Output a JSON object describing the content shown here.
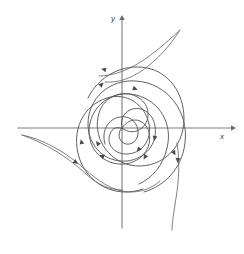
{
  "figure": {
    "name": "phase-portrait-spiral",
    "background_color": "#ffffff",
    "axis_color": "#7d7d7d",
    "curve_color": "#585858",
    "arrow_color": "#4a4a4a"
  },
  "axes": {
    "x_label": "x",
    "y_label": "y",
    "origin": {
      "x": 122,
      "y": 128
    },
    "x_axis": {
      "x1": 18,
      "y1": 128,
      "x2": 232,
      "y2": 128
    },
    "y_axis": {
      "x1": 122,
      "y1": 228,
      "x2": 122,
      "y2": 18
    }
  },
  "chart_data": {
    "type": "line",
    "title": "",
    "xlabel": "x",
    "ylabel": "y",
    "grid": false,
    "legend": false,
    "xlim": [
      -104,
      110
    ],
    "ylim": [
      -100,
      110
    ],
    "series": [
      {
        "name": "branch-1-upper-right-escape",
        "stroke": "#585858",
        "path": "M 122 128 C 126 122 133 118 140 121 C 149 125 152 137 148 147 C 143 160 128 167 113 163 C 95 158 86 141 90 123 C 95 102 115 90 136 95 C 160 101 173 124 167 148 C 163 166 152 178 139 184",
        "arrows": [
          {
            "x": 146,
            "y": 155,
            "angle": 118
          },
          {
            "x": 99,
            "y": 145,
            "angle": 232
          }
        ]
      },
      {
        "name": "branch-2-outer-counterclockwise",
        "stroke": "#585858",
        "path": "M 122 128 C 120 121 123 113 130 110 C 141 105 153 113 155 126 C 158 144 145 159 127 161 C 105 163 88 146 88 124 C 88 98 110 79 136 81 C 167 83 189 111 185 143 C 182 168 165 186 144 192",
        "arrows": [
          {
            "x": 155,
            "y": 136,
            "angle": 100
          },
          {
            "x": 104,
            "y": 157,
            "angle": 205
          }
        ]
      },
      {
        "name": "branch-3-wide-spiral",
        "stroke": "#585858",
        "path": "M 123 129 C 117 126 112 128 110 134 C 106 144 114 154 126 154 C 142 154 152 140 149 124 C 145 104 126 92 107 98 C 83 105 71 131 79 157 C 87 184 116 199 143 189",
        "arrows": [
          {
            "x": 140,
            "y": 148,
            "angle": 130
          },
          {
            "x": 82,
            "y": 144,
            "angle": 255
          }
        ]
      },
      {
        "name": "branch-4-outermost-spiral",
        "stroke": "#585858",
        "path": "M 122 128 C 128 133 136 133 142 128 C 151 120 150 105 139 98 C 124 88 104 96 99 113 C 92 136 107 160 130 165 C 159 171 184 149 184 119 C 184 92 168 72 147 68 C 122 63 98 77 88 98",
        "arrows": [
          {
            "x": 173,
            "y": 151,
            "angle": 60
          },
          {
            "x": 100,
            "y": 86,
            "angle": 315
          }
        ]
      },
      {
        "name": "branch-5-lower-left-inflow",
        "stroke": "#6a6a6a",
        "path": "M 22 135 C 42 139 62 150 80 165 C 95 178 107 188 122 191 C 136 194 150 190 160 181",
        "arrows": [
          {
            "x": 74,
            "y": 161,
            "angle": 35
          }
        ]
      },
      {
        "name": "branch-6-upper-right-outflow",
        "stroke": "#6a6a6a",
        "path": "M 180 30 C 166 43 152 55 139 63 C 126 71 112 76 99 76",
        "arrows": []
      },
      {
        "name": "branch-7-lower-right-outflow",
        "stroke": "#6a6a6a",
        "path": "M 177 143 C 180 160 179 180 176 198 C 174 212 172 222 172 230",
        "arrows": [
          {
            "x": 178,
            "y": 158,
            "angle": 95
          }
        ]
      },
      {
        "name": "branch-8-inner-small-loop",
        "stroke": "#585858",
        "path": "M 122 128 C 118 132 118 138 122 142 C 128 147 137 143 138 134 C 139 123 130 115 120 117 C 108 119 101 131 105 144",
        "arrows": []
      }
    ]
  }
}
